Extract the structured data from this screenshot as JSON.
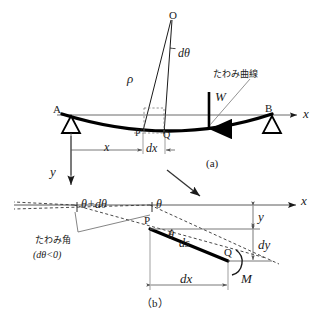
{
  "figure": {
    "type": "beam-deflection-diagram",
    "language": "ja",
    "background_color": "#ffffff",
    "ink_color": "#1a1a1a",
    "panels": [
      {
        "id": "a",
        "caption": "(a)",
        "description": "Simply supported beam AB with concentrated load W and radius of curvature rho from centre O"
      },
      {
        "id": "b",
        "caption": "（b）",
        "description": "Enlarged beam element PQ showing deflection angle theta, ds, dx, dy and bending moment M"
      }
    ]
  },
  "panel_a": {
    "point_o": "O",
    "d_theta": "dθ",
    "rho": "ρ",
    "load_w": "W",
    "support_a": "A",
    "support_b": "B",
    "axis_x": "x",
    "axis_y": "y",
    "point_p": "P",
    "point_p_prime": "P'",
    "point_q": "Q",
    "dim_x": "x",
    "dim_dx": "dx",
    "curve_label": "たわみ曲線",
    "curve_label_meaning": "deflection curve",
    "caption": "(a)"
  },
  "panel_b": {
    "axis_x": "x",
    "angle_theta": "θ",
    "angle_theta_plus_dtheta": "θ+dθ",
    "deflection_angle_label": "たわみ角",
    "deflection_angle_meaning": "deflection angle",
    "dtheta_condition": "(dθ<0)",
    "point_p": "P",
    "point_q": "Q",
    "arc_ds": "ds",
    "theta_at_p": "θ",
    "dim_y": "y",
    "dim_dy": "dy",
    "dim_dx": "dx",
    "moment_m": "M",
    "caption": "（b）"
  },
  "connector": {
    "name": "zoom-arrow",
    "from": "panel-a",
    "to": "panel-b"
  }
}
